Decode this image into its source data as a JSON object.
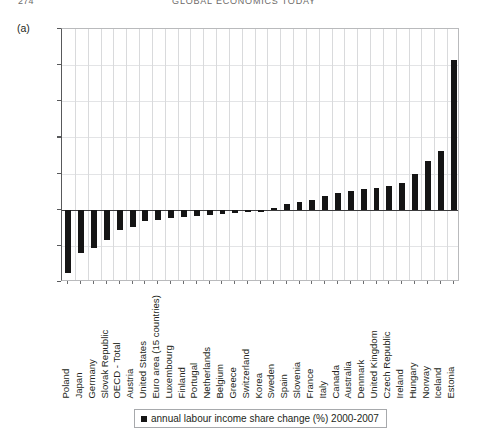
{
  "page_header": {
    "folio": "274",
    "running_head": "GLOBAL ECONOMICS TODAY"
  },
  "figure": {
    "panel_label": "(a)",
    "legend_text": "annual labour income share change (%) 2000-2007",
    "legend_marker": "filled-square-marker"
  },
  "chart_data": {
    "type": "bar",
    "title": "",
    "subtitle": "",
    "xlabel": "",
    "ylabel": "",
    "ylim": [
      -4,
      10
    ],
    "yticks": [
      -4,
      -2,
      0,
      2,
      4,
      6,
      8,
      10
    ],
    "ytick_labels": [
      "-4",
      "-2",
      "0",
      "2",
      "4",
      "6",
      "8",
      "10"
    ],
    "grid": "both",
    "legend_position": "bottom-center",
    "series_name": "annual labour income share change (%) 2000-2007",
    "bar_color": "#151515",
    "categories": [
      "Poland",
      "Japan",
      "Germany",
      "Slovak Republic",
      "OECD - Total",
      "Austria",
      "United States",
      "Euro area (15 countries)",
      "Luxembourg",
      "Finland",
      "Portugal",
      "Netherlands",
      "Belgium",
      "Greece",
      "Switzerland",
      "Korea",
      "Sweden",
      "Spain",
      "Slovenia",
      "France",
      "Italy",
      "Canada",
      "Australia",
      "Denmark",
      "United Kingdom",
      "Czech Republic",
      "Ireland",
      "Hungary",
      "Norway",
      "Iceland",
      "Estonia"
    ],
    "values": [
      -3.5,
      -2.4,
      -2.1,
      -1.7,
      -1.1,
      -0.95,
      -0.6,
      -0.55,
      -0.45,
      -0.4,
      -0.35,
      -0.3,
      -0.25,
      -0.2,
      -0.15,
      -0.1,
      0.1,
      0.3,
      0.4,
      0.55,
      0.75,
      0.95,
      1.05,
      1.15,
      1.2,
      1.3,
      1.5,
      2.0,
      2.7,
      3.25,
      8.3
    ]
  }
}
